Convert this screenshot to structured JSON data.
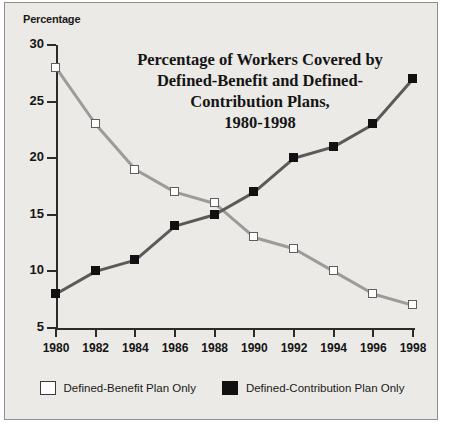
{
  "chart_data": {
    "type": "line",
    "title_lines": [
      "Percentage of Workers Covered by",
      "Defined-Benefit and Defined-",
      "Contribution Plans,",
      "1980-1998"
    ],
    "xlabel": "",
    "ylabel": "Percentage",
    "categories": [
      1980,
      1982,
      1984,
      1986,
      1988,
      1990,
      1992,
      1994,
      1996,
      1998
    ],
    "xtick_labels": [
      "1980",
      "1982",
      "1984",
      "1986",
      "1988",
      "1990",
      "1992",
      "1994",
      "1996",
      "1998"
    ],
    "ytick_labels": [
      "30",
      "25",
      "20",
      "15",
      "10",
      "5"
    ],
    "yticks": [
      30,
      25,
      20,
      15,
      10,
      5
    ],
    "ylim": [
      5,
      30
    ],
    "xlim": [
      1980,
      1998
    ],
    "grid": false,
    "legend_position": "bottom",
    "series": [
      {
        "name": "Defined-Benefit Plan Only",
        "marker": "open-square",
        "color": "#ffffff",
        "line_color": "#9b9b9b",
        "values": [
          28,
          23,
          19,
          17,
          16,
          13,
          12,
          10,
          8,
          7
        ]
      },
      {
        "name": "Defined-Contribution Plan Only",
        "marker": "filled-square",
        "color": "#111111",
        "line_color": "#5a5a5a",
        "values": [
          8,
          10,
          11,
          14,
          15,
          17,
          20,
          21,
          23,
          27
        ]
      }
    ]
  },
  "legend": {
    "items": [
      {
        "label": "Defined-Benefit Plan Only",
        "style": "open"
      },
      {
        "label": "Defined-Contribution Plan Only",
        "style": "solid"
      }
    ]
  },
  "colors": {
    "background": "#eceae6",
    "frame_border": "#8e8e8e",
    "axis": "#2b2b2b",
    "text": "#151515",
    "series_benefit_line": "#9b9b9b",
    "series_contribution_line": "#5a5a5a"
  }
}
